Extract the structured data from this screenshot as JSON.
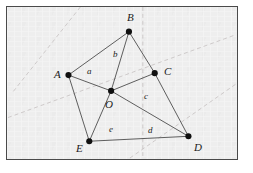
{
  "figure": {
    "kind": "geometry-diagram",
    "width": 253,
    "height": 173,
    "background_color": "#ffffff",
    "paper_color": "#eeeeee",
    "frame_color": "#4a4a4a",
    "ink_color": "#4a4a4a",
    "dashed_color": "#c9c4c4",
    "vertex_color": "#101010"
  },
  "vertices": [
    {
      "label": "A",
      "x": 68,
      "y": 75,
      "label_x": 53,
      "label_y": 68,
      "name": "vertex-a"
    },
    {
      "label": "B",
      "x": 129,
      "y": 31,
      "label_x": 126,
      "label_y": 11,
      "name": "vertex-b"
    },
    {
      "label": "C",
      "x": 155,
      "y": 73,
      "label_x": 163,
      "label_y": 65,
      "name": "vertex-c"
    },
    {
      "label": "O",
      "x": 111,
      "y": 91,
      "label_x": 104,
      "label_y": 98,
      "name": "vertex-o"
    },
    {
      "label": "D",
      "x": 189,
      "y": 137,
      "label_x": 193,
      "label_y": 141,
      "name": "vertex-d"
    },
    {
      "label": "E",
      "x": 89,
      "y": 142,
      "label_x": 75,
      "label_y": 142,
      "name": "vertex-e"
    }
  ],
  "segments": [
    {
      "from": "A",
      "to": "B",
      "name": "segment-ab"
    },
    {
      "from": "B",
      "to": "C",
      "name": "segment-bc"
    },
    {
      "from": "B",
      "to": "O",
      "name": "segment-bo"
    },
    {
      "from": "A",
      "to": "O",
      "name": "segment-ao"
    },
    {
      "from": "O",
      "to": "C",
      "name": "segment-oc"
    },
    {
      "from": "C",
      "to": "D",
      "name": "segment-cd"
    },
    {
      "from": "O",
      "to": "D",
      "name": "segment-od"
    },
    {
      "from": "O",
      "to": "E",
      "name": "segment-oe"
    },
    {
      "from": "A",
      "to": "E",
      "name": "segment-ae"
    },
    {
      "from": "E",
      "to": "D",
      "name": "segment-ed"
    }
  ],
  "segment_labels": [
    {
      "label": "a",
      "x": 86,
      "y": 66,
      "name": "segment-label-a"
    },
    {
      "label": "b",
      "x": 112,
      "y": 49,
      "name": "segment-label-b"
    },
    {
      "label": "c",
      "x": 143,
      "y": 91,
      "name": "segment-label-c"
    },
    {
      "label": "d",
      "x": 147,
      "y": 125,
      "name": "segment-label-d"
    },
    {
      "label": "e",
      "x": 108,
      "y": 124,
      "name": "segment-label-e"
    }
  ],
  "guide_lines": [
    {
      "x1": 80,
      "y1": 6,
      "x2": 12,
      "y2": 92,
      "name": "guide-line-upper-left"
    },
    {
      "x1": 7,
      "y1": 118,
      "x2": 237,
      "y2": 34,
      "name": "guide-line-diagonal-lower"
    },
    {
      "x1": 130,
      "y1": 159,
      "x2": 237,
      "y2": 84,
      "name": "guide-line-diagonal-right"
    },
    {
      "x1": 143,
      "y1": 6,
      "x2": 143,
      "y2": 159,
      "name": "guide-line-vertical"
    }
  ]
}
